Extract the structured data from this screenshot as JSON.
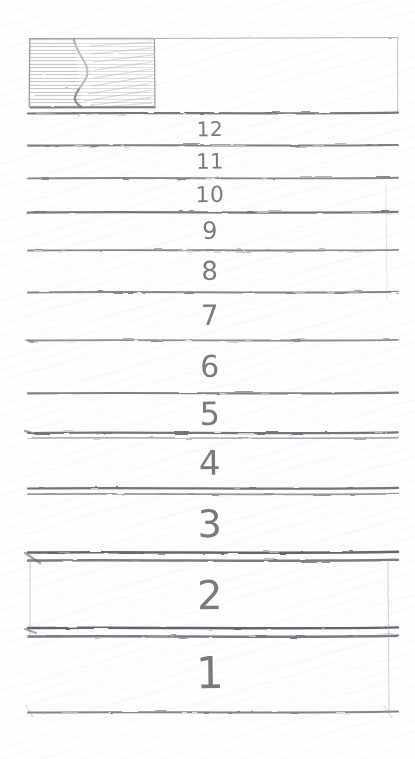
{
  "sketch": {
    "medium": "pencil-on-paper",
    "title": "Hand-drawn list wireframe",
    "paper_color": "#fefefe",
    "ink_color": "#6f6f74",
    "sheet": {
      "left": 27,
      "right": 398,
      "top": 36,
      "bottom": 713
    }
  },
  "header": {
    "name": "header-bar",
    "top": 36,
    "bottom": 113,
    "thumbnail": {
      "label": "shaded-thumbnail-block",
      "left": 29,
      "right": 155,
      "hatch": "horizontal-strokes",
      "inner_shape": "curved-silhouette"
    },
    "field": {
      "label": "empty-header-field",
      "left": 155,
      "right": 398
    }
  },
  "rows": [
    {
      "label": "12",
      "top": 113,
      "bottom": 145,
      "font_size": 20,
      "divider": "single"
    },
    {
      "label": "11",
      "top": 145,
      "bottom": 178,
      "font_size": 21,
      "divider": "single"
    },
    {
      "label": "10",
      "top": 178,
      "bottom": 212,
      "font_size": 22,
      "divider": "single"
    },
    {
      "label": "9",
      "top": 212,
      "bottom": 250,
      "font_size": 24,
      "divider": "single"
    },
    {
      "label": "8",
      "top": 250,
      "bottom": 292,
      "font_size": 26,
      "divider": "single"
    },
    {
      "label": "7",
      "top": 292,
      "bottom": 340,
      "font_size": 28,
      "divider": "single"
    },
    {
      "label": "6",
      "top": 340,
      "bottom": 393,
      "font_size": 30,
      "divider": "single"
    },
    {
      "label": "5",
      "top": 393,
      "bottom": 435,
      "font_size": 32,
      "divider": "single"
    },
    {
      "label": "4",
      "top": 435,
      "bottom": 491,
      "font_size": 34,
      "divider": "double"
    },
    {
      "label": "3",
      "top": 491,
      "bottom": 557,
      "font_size": 38,
      "divider": "double"
    },
    {
      "label": "2",
      "top": 557,
      "bottom": 633,
      "font_size": 40,
      "divider": "double"
    },
    {
      "label": "1",
      "top": 633,
      "bottom": 713,
      "font_size": 44,
      "divider": "double"
    }
  ],
  "label_center_x": 210
}
